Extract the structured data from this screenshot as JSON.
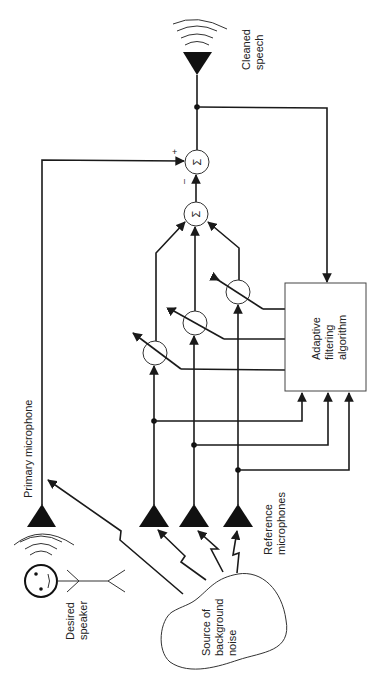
{
  "diagram": {
    "labels": {
      "cleaned_speech": [
        "Cleaned",
        "speech"
      ],
      "primary_microphone": "Primary microphone",
      "desired_speaker": [
        "Desired",
        "speaker"
      ],
      "reference_microphones": [
        "Reference",
        "microphones"
      ],
      "noise_source": [
        "Source of",
        "background",
        "noise"
      ],
      "adaptive_box": [
        "Adaptive",
        "filtering",
        "algorithm"
      ],
      "sum_symbol": "Σ",
      "plus": "+",
      "minus": "–"
    },
    "nodes": [
      {
        "id": "primary-mic"
      },
      {
        "id": "ref-mic-1"
      },
      {
        "id": "ref-mic-2"
      },
      {
        "id": "ref-mic-3"
      },
      {
        "id": "weight-1"
      },
      {
        "id": "weight-2"
      },
      {
        "id": "weight-3"
      },
      {
        "id": "sum-weights"
      },
      {
        "id": "sum-output"
      },
      {
        "id": "adaptive-filter"
      },
      {
        "id": "output-speaker"
      }
    ]
  }
}
